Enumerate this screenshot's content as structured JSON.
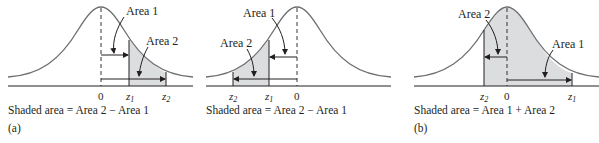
{
  "panels": [
    {
      "id": "a1",
      "area1_label": "Area 1",
      "area2_label": "Area 2",
      "ticks": {
        "zero": "0",
        "z1": "z",
        "z1_sub": "1",
        "z2": "z",
        "z2_sub": "2"
      },
      "caption": "Shaded area = Area 2 − Area 1",
      "part_label": "(a)"
    },
    {
      "id": "a2",
      "area1_label": "Area 1",
      "area2_label": "Area 2",
      "ticks": {
        "zero": "0",
        "z1": "z",
        "z1_sub": "1",
        "z2": "z",
        "z2_sub": "2"
      },
      "caption": "Shaded area = Area 2 − Area 1"
    },
    {
      "id": "b",
      "area1_label": "Area 1",
      "area2_label": "Area 2",
      "ticks": {
        "zero": "0",
        "z1": "z",
        "z1_sub": "1",
        "z2": "z",
        "z2_sub": "2"
      },
      "caption": "Shaded area = Area 1 + Area 2",
      "part_label": "(b)"
    }
  ],
  "colors": {
    "curve": "#6d6e71",
    "shade": "#dcdddf",
    "ink": "#231f20"
  }
}
